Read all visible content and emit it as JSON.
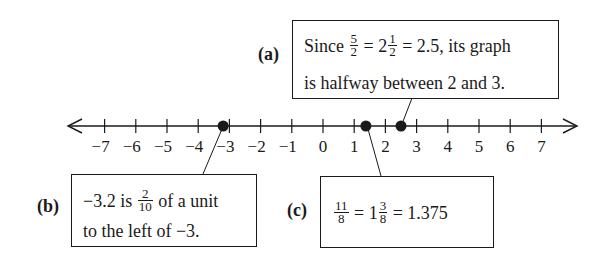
{
  "number_line": {
    "min": -7,
    "max": 7,
    "tick_labels": [
      "−7",
      "−6",
      "−5",
      "−4",
      "−3",
      "−2",
      "−1",
      "0",
      "1",
      "2",
      "3",
      "4",
      "5",
      "6",
      "7"
    ],
    "tick_values": [
      -7,
      -6,
      -5,
      -4,
      -3,
      -2,
      -1,
      0,
      1,
      2,
      3,
      4,
      5,
      6,
      7
    ],
    "arrows": "both",
    "points": [
      {
        "id": "b",
        "value": -3.2
      },
      {
        "id": "c",
        "value": 1.375
      },
      {
        "id": "a",
        "value": 2.5
      }
    ],
    "line_color": "#1a1a1a",
    "point_color": "#1a1a1a"
  },
  "callouts": {
    "a": {
      "label": "(a)",
      "line1": {
        "pre": "Since ",
        "frac1": {
          "num": "5",
          "den": "2"
        },
        "mid": " = 2",
        "frac2": {
          "num": "1",
          "den": "2"
        },
        "post": " = 2.5, its graph"
      },
      "line2": "is halfway between 2 and 3."
    },
    "b": {
      "label": "(b)",
      "line1": {
        "pre": "−3.2 is ",
        "frac1": {
          "num": "2",
          "den": "10"
        },
        "post": " of a unit"
      },
      "line2": "to the left of −3."
    },
    "c": {
      "label": "(c)",
      "line1": {
        "frac1": {
          "num": "11",
          "den": "8"
        },
        "mid": " = 1",
        "frac2": {
          "num": "3",
          "den": "8"
        },
        "post": " = 1.375"
      }
    }
  }
}
